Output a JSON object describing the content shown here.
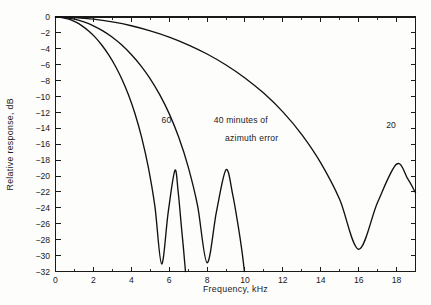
{
  "chart_data": {
    "type": "line",
    "title": "",
    "xlabel": "Frequency, kHz",
    "ylabel": "Relative response, dB",
    "xlim": [
      0,
      19
    ],
    "ylim": [
      -32,
      0
    ],
    "grid": false,
    "legend_position": "inline-annotations",
    "xticks": [
      0,
      2,
      4,
      6,
      8,
      10,
      12,
      14,
      16,
      18
    ],
    "xtick_labels": [
      "0",
      "2",
      "4",
      "6",
      "8",
      "10",
      "12",
      "14",
      "16",
      "18"
    ],
    "x_minor_tick_step": 1,
    "yticks": [
      0,
      -2,
      -4,
      -6,
      -8,
      -10,
      -12,
      -14,
      -16,
      -18,
      -20,
      -22,
      -24,
      -26,
      -28,
      -30,
      -32
    ],
    "ytick_labels": [
      "0",
      "−2",
      "−4",
      "−6",
      "−8",
      "−10",
      "−12",
      "−14",
      "−16",
      "−18",
      "−20",
      "−22",
      "−24",
      "−26",
      "−28",
      "−30",
      "−32"
    ],
    "annotations": [
      {
        "name": "curve-label-60",
        "text": "60",
        "x": 5.6,
        "y": -13.3
      },
      {
        "name": "curve-label-40-line1",
        "text": "40  minutes of",
        "x": 8.35,
        "y": -13.3
      },
      {
        "name": "curve-label-40-line2",
        "text": "azimuth error",
        "x": 8.95,
        "y": -15.6
      },
      {
        "name": "curve-label-20",
        "text": "20",
        "x": 17.45,
        "y": -14.0
      }
    ],
    "series": [
      {
        "name": "60 minutes of azimuth error",
        "label": "60",
        "x": [
          0.0,
          0.35,
          0.7,
          1.05,
          1.4,
          1.75,
          2.1,
          2.45,
          2.8,
          3.15,
          3.5,
          3.85,
          4.2,
          4.55,
          4.9,
          5.25,
          5.6,
          5.95,
          6.3,
          6.475,
          6.65,
          6.75,
          6.82,
          6.86
        ],
        "y": [
          0.0,
          -0.07,
          -0.27,
          -0.62,
          -1.11,
          -1.76,
          -2.56,
          -3.55,
          -4.73,
          -6.13,
          -7.8,
          -9.79,
          -12.2,
          -15.16,
          -18.91,
          -23.87,
          -31.05,
          -24.5,
          -19.3,
          -22.0,
          -26.5,
          -29.0,
          -30.9,
          -32.0
        ]
      },
      {
        "name": "40 minutes of azimuth error",
        "label": "40",
        "x": [
          0.0,
          0.5,
          1.0,
          1.5,
          2.0,
          2.5,
          3.0,
          3.5,
          4.0,
          4.5,
          5.0,
          5.5,
          6.0,
          6.5,
          7.0,
          7.5,
          8.0,
          8.5,
          9.0,
          9.35,
          9.65,
          9.85,
          9.97
        ],
        "y": [
          0.0,
          -0.07,
          -0.27,
          -0.62,
          -1.11,
          -1.75,
          -2.55,
          -3.53,
          -4.71,
          -6.11,
          -7.77,
          -9.76,
          -12.15,
          -15.1,
          -18.82,
          -23.75,
          -30.9,
          -24.4,
          -19.2,
          -22.3,
          -26.4,
          -29.6,
          -32.0
        ]
      },
      {
        "name": "20 minutes of azimuth error",
        "label": "20",
        "x": [
          0.0,
          1.0,
          2.0,
          3.0,
          4.0,
          5.0,
          6.0,
          7.0,
          8.0,
          9.0,
          10.0,
          11.0,
          12.0,
          13.0,
          14.0,
          15.0,
          16.0,
          17.0,
          18.0,
          18.6,
          19.0
        ],
        "y": [
          0.0,
          -0.07,
          -0.27,
          -0.62,
          -1.1,
          -1.74,
          -2.52,
          -3.49,
          -4.65,
          -6.03,
          -7.66,
          -9.6,
          -11.93,
          -14.79,
          -18.35,
          -22.95,
          -29.2,
          -23.3,
          -18.5,
          -20.4,
          -22.1
        ]
      }
    ]
  },
  "axis_titles": {
    "x": "Frequency, kHz",
    "y": "Relative response, dB"
  }
}
